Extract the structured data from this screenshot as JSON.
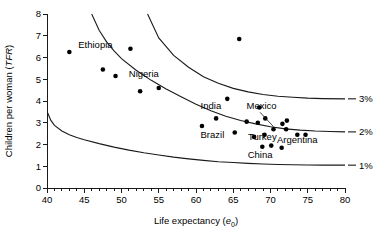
{
  "chart_data": {
    "type": "scatter",
    "title": "",
    "xlabel": "Life expectancy (e0)",
    "xlabel_main": "Life expectancy (",
    "xlabel_italic": "e",
    "xlabel_sub": "0",
    "xlabel_close": ")",
    "ylabel": "Children per woman (TFR)",
    "ylabel_main": "Children per woman (",
    "ylabel_italic": "TFR",
    "ylabel_close": ")",
    "xlim": [
      40,
      80
    ],
    "ylim": [
      0,
      8
    ],
    "xticks": [
      40,
      45,
      50,
      55,
      60,
      65,
      70,
      75,
      80
    ],
    "yticks": [
      0,
      1,
      2,
      3,
      4,
      5,
      6,
      7,
      8
    ],
    "xminor_step": 1,
    "grid": false,
    "legend": "none",
    "points": [
      {
        "x": 43.0,
        "y": 6.25,
        "label": ""
      },
      {
        "x": 47.5,
        "y": 5.45,
        "label": ""
      },
      {
        "x": 49.2,
        "y": 5.15,
        "label": ""
      },
      {
        "x": 52.5,
        "y": 4.45,
        "label": ""
      },
      {
        "x": 55.0,
        "y": 4.6,
        "label": ""
      },
      {
        "x": 51.2,
        "y": 6.4,
        "label": "Ethiopia"
      },
      {
        "x": 64.2,
        "y": 4.1,
        "label": ""
      },
      {
        "x": 65.8,
        "y": 6.85,
        "label": ""
      },
      {
        "x": 60.8,
        "y": 2.85,
        "label": ""
      },
      {
        "x": 62.7,
        "y": 3.2,
        "label": ""
      },
      {
        "x": 65.2,
        "y": 2.55,
        "label": ""
      },
      {
        "x": 66.8,
        "y": 3.05,
        "label": ""
      },
      {
        "x": 68.3,
        "y": 3.0,
        "label": ""
      },
      {
        "x": 68.5,
        "y": 3.7,
        "label": ""
      },
      {
        "x": 69.3,
        "y": 3.2,
        "label": ""
      },
      {
        "x": 70.4,
        "y": 2.7,
        "label": ""
      },
      {
        "x": 71.6,
        "y": 2.95,
        "label": ""
      },
      {
        "x": 72.2,
        "y": 3.1,
        "label": ""
      },
      {
        "x": 72.1,
        "y": 2.7,
        "label": ""
      },
      {
        "x": 73.6,
        "y": 2.45,
        "label": ""
      },
      {
        "x": 74.7,
        "y": 2.45,
        "label": ""
      },
      {
        "x": 67.8,
        "y": 2.35,
        "label": ""
      },
      {
        "x": 69.2,
        "y": 2.45,
        "label": ""
      },
      {
        "x": 68.9,
        "y": 1.9,
        "label": ""
      },
      {
        "x": 70.1,
        "y": 1.95,
        "label": ""
      },
      {
        "x": 71.5,
        "y": 1.85,
        "label": ""
      }
    ],
    "annotations": [
      {
        "text": "Ethiopia",
        "x": 46.5,
        "y": 6.42
      },
      {
        "text": "Nigeria",
        "x": 53.0,
        "y": 5.12
      },
      {
        "text": "India",
        "x": 62.0,
        "y": 3.62
      },
      {
        "text": "Mexico",
        "x": 68.8,
        "y": 3.62
      },
      {
        "text": "Brazil",
        "x": 62.2,
        "y": 2.28
      },
      {
        "text": "Turkey",
        "x": 68.9,
        "y": 2.22
      },
      {
        "text": "Argentina",
        "x": 73.6,
        "y": 2.05
      },
      {
        "text": "China",
        "x": 68.6,
        "y": 1.38
      }
    ],
    "curve_labels": [
      {
        "text": "3%",
        "y_at_x80": 4.1
      },
      {
        "text": "2%",
        "y_at_x80": 2.58
      },
      {
        "text": "1%",
        "y_at_x80": 1.05
      }
    ],
    "curves": [
      {
        "name": "3%",
        "points": [
          [
            53.5,
            8.0
          ],
          [
            55,
            6.9
          ],
          [
            57,
            6.1
          ],
          [
            59,
            5.55
          ],
          [
            61,
            5.12
          ],
          [
            63,
            4.82
          ],
          [
            65,
            4.58
          ],
          [
            67,
            4.42
          ],
          [
            69,
            4.3
          ],
          [
            71,
            4.22
          ],
          [
            73,
            4.17
          ],
          [
            75,
            4.13
          ],
          [
            77,
            4.11
          ],
          [
            80,
            4.1
          ]
        ]
      },
      {
        "name": "2%",
        "points": [
          [
            46.0,
            8.0
          ],
          [
            47,
            7.25
          ],
          [
            48,
            6.72
          ],
          [
            49,
            6.3
          ],
          [
            50,
            5.95
          ],
          [
            52,
            5.4
          ],
          [
            54,
            4.95
          ],
          [
            56,
            4.55
          ],
          [
            58,
            4.2
          ],
          [
            60,
            3.85
          ],
          [
            62,
            3.55
          ],
          [
            64,
            3.3
          ],
          [
            66,
            3.1
          ],
          [
            68,
            2.95
          ],
          [
            70,
            2.82
          ],
          [
            72,
            2.72
          ],
          [
            74,
            2.66
          ],
          [
            76,
            2.62
          ],
          [
            78,
            2.6
          ],
          [
            80,
            2.58
          ]
        ]
      },
      {
        "name": "1%",
        "points": [
          [
            40.1,
            3.45
          ],
          [
            40.5,
            3.12
          ],
          [
            41,
            2.88
          ],
          [
            42,
            2.62
          ],
          [
            43,
            2.45
          ],
          [
            44,
            2.32
          ],
          [
            45,
            2.22
          ],
          [
            47,
            2.04
          ],
          [
            49,
            1.88
          ],
          [
            51,
            1.74
          ],
          [
            53,
            1.62
          ],
          [
            55,
            1.52
          ],
          [
            57,
            1.42
          ],
          [
            59,
            1.34
          ],
          [
            61,
            1.27
          ],
          [
            63,
            1.21
          ],
          [
            65,
            1.17
          ],
          [
            67,
            1.13
          ],
          [
            69,
            1.1
          ],
          [
            71,
            1.08
          ],
          [
            73,
            1.07
          ],
          [
            75,
            1.06
          ],
          [
            77,
            1.05
          ],
          [
            80,
            1.05
          ]
        ]
      }
    ]
  },
  "figure": {
    "background_color": "#ffffff",
    "axis_color": "#1a1a1a",
    "point_color": "#000000"
  }
}
